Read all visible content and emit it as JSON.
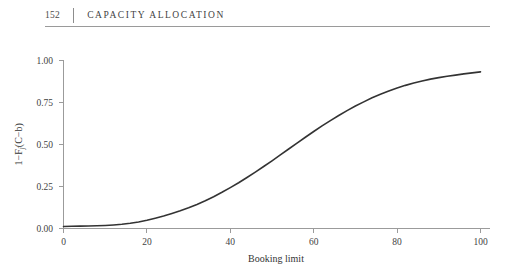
{
  "page": {
    "folio": "152",
    "running_title": "CAPACITY ALLOCATION"
  },
  "chart_data": {
    "type": "line",
    "title": "",
    "xlabel": "Booking limit",
    "ylabel": "1-F_j(C-b)",
    "ylabel_parts": {
      "lead": "1−F",
      "subscript": "j",
      "tail": "(C−b)"
    },
    "xlim": [
      0,
      100
    ],
    "ylim": [
      0.0,
      1.0
    ],
    "grid": false,
    "legend": null,
    "xticks": [
      0,
      20,
      40,
      60,
      80,
      100
    ],
    "xtick_labels": [
      "0",
      "20",
      "40",
      "60",
      "80",
      "100"
    ],
    "yticks": [
      0.0,
      0.25,
      0.5,
      0.75,
      1.0
    ],
    "ytick_labels": [
      "0.00",
      "0.25",
      "0.50",
      "0.75",
      "1.00"
    ],
    "line_color": "#333333",
    "axis_color": "#9b9b9b",
    "series": [
      {
        "name": "1-F_j(C-b)",
        "x": [
          0,
          2,
          4,
          6,
          8,
          10,
          12,
          14,
          16,
          18,
          20,
          22,
          24,
          26,
          28,
          30,
          32,
          34,
          36,
          38,
          40,
          42,
          44,
          46,
          48,
          50,
          52,
          54,
          56,
          58,
          60,
          62,
          64,
          66,
          68,
          70,
          72,
          74,
          76,
          78,
          80,
          82,
          84,
          86,
          88,
          90,
          92,
          94,
          96,
          98,
          100
        ],
        "values": [
          0.012,
          0.013,
          0.014,
          0.015,
          0.016,
          0.018,
          0.021,
          0.025,
          0.031,
          0.039,
          0.049,
          0.061,
          0.074,
          0.089,
          0.105,
          0.123,
          0.143,
          0.165,
          0.189,
          0.215,
          0.243,
          0.272,
          0.303,
          0.335,
          0.368,
          0.402,
          0.437,
          0.472,
          0.507,
          0.542,
          0.576,
          0.609,
          0.641,
          0.671,
          0.7,
          0.727,
          0.752,
          0.776,
          0.797,
          0.816,
          0.834,
          0.85,
          0.864,
          0.876,
          0.887,
          0.896,
          0.904,
          0.911,
          0.918,
          0.924,
          0.93
        ]
      }
    ]
  }
}
